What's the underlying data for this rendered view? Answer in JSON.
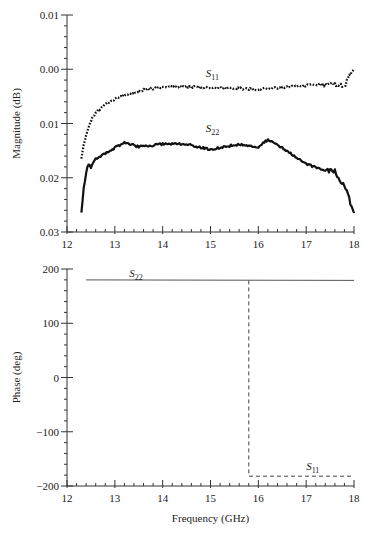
{
  "chart_data": [
    {
      "type": "line",
      "panel": "top",
      "title": "",
      "xlabel": "",
      "ylabel": "Magnitude (dB)",
      "xlim": [
        12,
        18
      ],
      "ylim": [
        0.01,
        -0.03
      ],
      "x_ticks": [
        12,
        13,
        14,
        15,
        16,
        17,
        18
      ],
      "y_ticks": [
        0.01,
        0.0,
        -0.01,
        -0.02,
        -0.03
      ],
      "y_tick_labels": [
        "0.01",
        "0.00",
        "0.01",
        "0.02",
        "0.03"
      ],
      "grid": false,
      "legend": "inline labels",
      "series": [
        {
          "name": "S11",
          "style": "dotted",
          "label_at": [
            14.9,
            -0.0015
          ],
          "x": [
            12.3,
            12.35,
            12.4,
            12.5,
            12.6,
            12.8,
            13.0,
            13.3,
            13.6,
            14.0,
            14.5,
            15.0,
            15.5,
            16.0,
            16.5,
            17.0,
            17.3,
            17.6,
            17.8,
            17.9,
            18.0
          ],
          "values": [
            -0.0165,
            -0.014,
            -0.012,
            -0.0095,
            -0.008,
            -0.0065,
            -0.0055,
            -0.0045,
            -0.0038,
            -0.0033,
            -0.0032,
            -0.0034,
            -0.0035,
            -0.0037,
            -0.0034,
            -0.003,
            -0.0028,
            -0.0027,
            -0.0032,
            -0.001,
            0.0
          ]
        },
        {
          "name": "S22",
          "style": "solid",
          "label_at": [
            14.9,
            -0.0115
          ],
          "x": [
            12.3,
            12.35,
            12.4,
            12.45,
            12.5,
            12.6,
            12.8,
            13.0,
            13.2,
            13.5,
            14.0,
            14.5,
            15.0,
            15.3,
            15.6,
            16.0,
            16.2,
            16.5,
            17.0,
            17.3,
            17.6,
            17.8,
            17.9,
            18.0
          ],
          "values": [
            -0.0265,
            -0.022,
            -0.019,
            -0.0175,
            -0.018,
            -0.0165,
            -0.0155,
            -0.0145,
            -0.0135,
            -0.0143,
            -0.0138,
            -0.0138,
            -0.0148,
            -0.0143,
            -0.0138,
            -0.0143,
            -0.013,
            -0.0145,
            -0.0175,
            -0.0183,
            -0.0188,
            -0.0215,
            -0.024,
            -0.0265
          ]
        }
      ]
    },
    {
      "type": "line",
      "panel": "bottom",
      "title": "",
      "xlabel": "Frequency (GHz)",
      "ylabel": "Phase (deg)",
      "xlim": [
        12,
        18
      ],
      "ylim": [
        200,
        -200
      ],
      "x_ticks": [
        12,
        13,
        14,
        15,
        16,
        17,
        18
      ],
      "y_ticks": [
        200,
        100,
        0,
        -100,
        -200
      ],
      "y_tick_labels": [
        "200",
        "100",
        "0",
        "−100",
        "−200"
      ],
      "grid": false,
      "legend": "inline labels",
      "series": [
        {
          "name": "S22",
          "style": "solid",
          "label_at": [
            13.3,
            186
          ],
          "x": [
            12.4,
            18.0
          ],
          "values": [
            180,
            179
          ]
        },
        {
          "name": "S11",
          "style": "dashed",
          "label_at": [
            17.0,
            -170
          ],
          "x": [
            15.8,
            15.8,
            18.0
          ],
          "values": [
            179,
            -182,
            -182
          ]
        }
      ]
    }
  ]
}
